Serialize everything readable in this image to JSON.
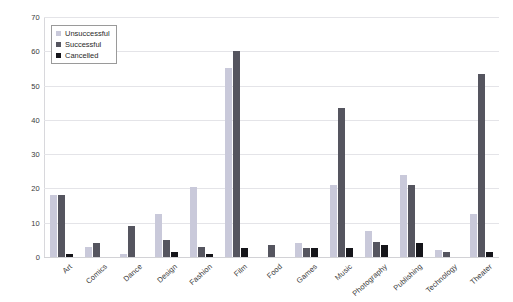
{
  "chart_data": {
    "type": "bar",
    "title": "",
    "xlabel": "",
    "ylabel": "",
    "ylim": [
      0,
      70
    ],
    "yticks": [
      0,
      10,
      20,
      30,
      40,
      50,
      60,
      70
    ],
    "grid": true,
    "legend_position": "upper-left",
    "categories": [
      "Art",
      "Comics",
      "Dance",
      "Design",
      "Fashion",
      "Film",
      "Food",
      "Games",
      "Music",
      "Photography",
      "Publishing",
      "Technology",
      "Theater"
    ],
    "series": [
      {
        "name": "Unsuccessful",
        "color": "#c9c9da",
        "values": [
          18,
          3,
          1,
          12.5,
          20.5,
          55,
          0,
          4,
          21,
          7.5,
          24,
          2,
          12.5
        ]
      },
      {
        "name": "Successful",
        "color": "#55555f",
        "values": [
          18,
          4,
          9,
          5,
          3,
          60,
          3.5,
          2.5,
          43.5,
          4.5,
          21,
          1.5,
          53.5
        ]
      },
      {
        "name": "Cancelled",
        "color": "#15151a",
        "values": [
          1,
          0,
          0,
          1.5,
          1,
          2.5,
          0,
          2.5,
          2.5,
          3.5,
          4,
          0,
          1.5
        ]
      }
    ]
  },
  "legend": {
    "items": [
      {
        "label": "Unsuccessful"
      },
      {
        "label": "Successful"
      },
      {
        "label": "Cancelled"
      }
    ]
  }
}
